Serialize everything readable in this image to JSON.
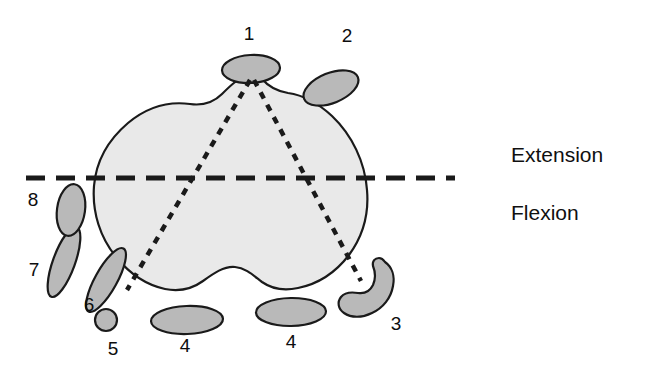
{
  "figure": {
    "name": "knee-cross-section-diagram",
    "type": "anatomical-cross-section",
    "background_color": "#ffffff"
  },
  "colors": {
    "main_body_fill": "#e9e9e9",
    "structure_fill": "#b9b9b9",
    "outline": "#1a1a1a",
    "dash_line": "#1a1a1a",
    "text": "#101010"
  },
  "side_labels": {
    "extension": "Extension",
    "flexion": "Flexion"
  },
  "number_labels": [
    {
      "id": "label-1",
      "text": "1",
      "x": 249,
      "y": 40
    },
    {
      "id": "label-2",
      "text": "2",
      "x": 347,
      "y": 42
    },
    {
      "id": "label-3",
      "text": "3",
      "x": 396,
      "y": 330
    },
    {
      "id": "label-4-left",
      "text": "4",
      "x": 185,
      "y": 352
    },
    {
      "id": "label-4-right",
      "text": "4",
      "x": 291,
      "y": 348
    },
    {
      "id": "label-5",
      "text": "5",
      "x": 113,
      "y": 355
    },
    {
      "id": "label-6",
      "text": "6",
      "x": 89,
      "y": 311
    },
    {
      "id": "label-7",
      "text": "7",
      "x": 34,
      "y": 276
    },
    {
      "id": "label-8",
      "text": "8",
      "x": 33,
      "y": 206
    }
  ],
  "structures": [
    {
      "id": "structure-1",
      "label": "1",
      "shape": "ellipse",
      "cx": 251,
      "cy": 69,
      "rx": 29,
      "ry": 14,
      "rotation": -3
    },
    {
      "id": "structure-2",
      "label": "2",
      "shape": "ellipse",
      "cx": 331,
      "cy": 88,
      "rx": 29,
      "ry": 15,
      "rotation": -22
    },
    {
      "id": "structure-3",
      "label": "3",
      "shape": "crescent"
    },
    {
      "id": "structure-4-left",
      "label": "4",
      "shape": "ellipse",
      "cx": 187,
      "cy": 320,
      "rx": 36,
      "ry": 14,
      "rotation": -2
    },
    {
      "id": "structure-4-right",
      "label": "4",
      "shape": "ellipse",
      "cx": 291,
      "cy": 312,
      "rx": 35,
      "ry": 14,
      "rotation": -1
    },
    {
      "id": "structure-5",
      "label": "5",
      "shape": "ellipse",
      "cx": 106,
      "cy": 320,
      "rx": 11,
      "ry": 11,
      "rotation": 0
    },
    {
      "id": "structure-6",
      "label": "6",
      "shape": "ellipse",
      "cx": 106,
      "cy": 280,
      "rx": 11,
      "ry": 36,
      "rotation": 29
    },
    {
      "id": "structure-7",
      "label": "7",
      "shape": "ellipse",
      "cx": 64,
      "cy": 262,
      "rx": 11,
      "ry": 37,
      "rotation": 20
    },
    {
      "id": "structure-8",
      "label": "8",
      "shape": "ellipse",
      "cx": 71,
      "cy": 210,
      "rx": 14,
      "ry": 26,
      "rotation": 8
    }
  ],
  "dashed_lines": {
    "horizontal": {
      "name": "flexion-extension-axis",
      "x1": 26,
      "y1": 178,
      "x2": 455,
      "y2": 178
    },
    "triangle_left": {
      "name": "left-ligament-line",
      "x1": 250,
      "y1": 80,
      "x2": 127,
      "y2": 290
    },
    "triangle_right": {
      "name": "right-ligament-line",
      "x1": 254,
      "y1": 80,
      "x2": 361,
      "y2": 281
    }
  }
}
